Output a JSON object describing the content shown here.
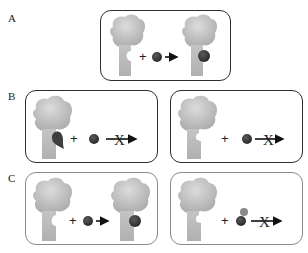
{
  "labels": {
    "a": "A",
    "b": "B",
    "c": "C"
  },
  "symbols": {
    "plus": "+",
    "blocked": "X"
  },
  "colors": {
    "receptor_top": "#c8c8c8",
    "receptor_stem": "#b9b9b9",
    "ligand": "#3b3b3b",
    "modified_tag": "#8a8a8a",
    "panel_border_dark": "#2e2e2e",
    "panel_border_light": "#8a8a8a",
    "arrow": "#111111"
  },
  "panels": [
    {
      "id": "A",
      "description": "Receptor with open pocket + ligand -> bound complex",
      "outcome": "binds"
    },
    {
      "id": "B-left",
      "description": "Receptor with occupied/misshapen pocket + ligand -> no binding",
      "outcome": "blocked"
    },
    {
      "id": "B-right",
      "description": "Receptor with altered pocket + ligand -> no binding",
      "outcome": "blocked"
    },
    {
      "id": "C-left",
      "description": "Receptor with open pocket + ligand -> bound complex",
      "outcome": "binds"
    },
    {
      "id": "C-right",
      "description": "Receptor + modified ligand (with attached group) -> no binding",
      "outcome": "blocked"
    }
  ]
}
